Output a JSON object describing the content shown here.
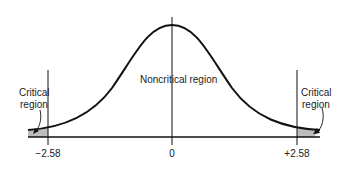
{
  "diagram": {
    "title": "",
    "labels": {
      "left_critical_line1": "Critical",
      "left_critical_line2": "region",
      "right_critical_line1": "Critical",
      "right_critical_line2": "region",
      "noncritical": "Noncritical region"
    },
    "ticks": {
      "left": "−2.58",
      "center": "0",
      "right": "+2.58"
    },
    "colors": {
      "curve": "#111111",
      "axis": "#111111",
      "shade": "#bdbdbd"
    }
  }
}
